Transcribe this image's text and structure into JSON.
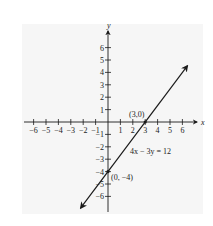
{
  "chart_data": {
    "type": "line",
    "title": "",
    "xlabel": "x",
    "ylabel": "y",
    "xlim": [
      -6,
      6
    ],
    "ylim": [
      -6,
      6
    ],
    "x_ticks": [
      -6,
      -5,
      -4,
      -3,
      -2,
      -1,
      1,
      2,
      3,
      4,
      5,
      6
    ],
    "y_ticks": [
      6,
      5,
      4,
      3,
      2,
      1,
      -1,
      -2,
      -3,
      -4,
      -5,
      -6
    ],
    "x_tick_labels": [
      "−6",
      "−5",
      "−4",
      "−3",
      "−2",
      "−1",
      "1",
      "2",
      "3",
      "4",
      "5",
      "6"
    ],
    "y_tick_labels": [
      "6",
      "5",
      "4",
      "3",
      "2",
      "1",
      "−1",
      "−2",
      "−3",
      "−4",
      "−5",
      "−6"
    ],
    "grid": false,
    "series": [
      {
        "name": "4x − 3y = 12",
        "equation": "4x - 3y = 12",
        "x": [
          -0.75,
          0,
          3,
          6.0
        ],
        "y": [
          -5,
          -4,
          0,
          4
        ]
      }
    ],
    "annotations": [
      {
        "text": "(3,0)",
        "x": 3,
        "y": 0
      },
      {
        "text": "(0, −4)",
        "x": 0,
        "y": -4
      },
      {
        "text": "4x − 3y = 12",
        "x": 3.2,
        "y": -2.2
      }
    ]
  },
  "labels": {
    "x_axis": "x",
    "y_axis": "y",
    "point_a": "(3,0)",
    "point_b": "(0, −4)",
    "equation": "4x − 3y = 12"
  },
  "colors": {
    "panel": "#f6f6f6",
    "ink": "#1a1a1a"
  }
}
